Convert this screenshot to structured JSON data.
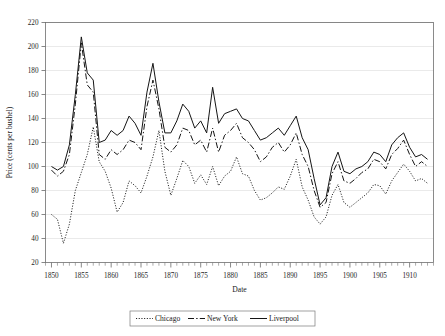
{
  "figure": {
    "title_clipped": "Wheat Prices: Chicago, New York and Liverpool",
    "background": "#ffffff",
    "ink_color": "#151515",
    "grid_color": "#d8d8d8"
  },
  "axes": {
    "ylabel": "Price (cents per bushel)",
    "xlabel": "Date",
    "ylim": [
      20,
      220
    ],
    "ytick_step": 20,
    "yticks": [
      20,
      40,
      60,
      80,
      100,
      120,
      140,
      160,
      180,
      200,
      220
    ],
    "xlim": [
      1849,
      1914
    ],
    "xtick_step": 5,
    "xticks": [
      1850,
      1855,
      1860,
      1865,
      1870,
      1875,
      1880,
      1885,
      1890,
      1895,
      1900,
      1905,
      1910
    ],
    "xminor_step": 1,
    "grid": "horizontal"
  },
  "legend": {
    "position": "below-axes",
    "entries": [
      {
        "label": "Chicago",
        "style": "dotted"
      },
      {
        "label": "New York",
        "style": "dash-dot"
      },
      {
        "label": "Liverpool",
        "style": "solid"
      }
    ]
  },
  "chart_data": {
    "type": "line",
    "title": "Wheat Prices: Chicago, New York and Liverpool",
    "xlabel": "Date",
    "ylabel": "Price (cents per bushel)",
    "xlim": [
      1849,
      1914
    ],
    "ylim": [
      20,
      220
    ],
    "grid": true,
    "legend_position": "bottom",
    "x": [
      1850,
      1851,
      1852,
      1853,
      1854,
      1855,
      1856,
      1857,
      1858,
      1859,
      1860,
      1861,
      1862,
      1863,
      1864,
      1865,
      1866,
      1867,
      1868,
      1869,
      1870,
      1871,
      1872,
      1873,
      1874,
      1875,
      1876,
      1877,
      1878,
      1879,
      1880,
      1881,
      1882,
      1883,
      1884,
      1885,
      1886,
      1887,
      1888,
      1889,
      1890,
      1891,
      1892,
      1893,
      1894,
      1895,
      1896,
      1897,
      1898,
      1899,
      1900,
      1901,
      1902,
      1903,
      1904,
      1905,
      1906,
      1907,
      1908,
      1909,
      1910,
      1911,
      1912,
      1913
    ],
    "series": [
      {
        "name": "Chicago",
        "style": "dotted",
        "values": [
          60,
          56,
          36,
          52,
          80,
          95,
          110,
          133,
          104,
          96,
          82,
          62,
          70,
          88,
          84,
          78,
          92,
          108,
          130,
          96,
          76,
          90,
          105,
          100,
          86,
          93,
          85,
          100,
          84,
          92,
          96,
          108,
          94,
          92,
          80,
          72,
          74,
          78,
          83,
          81,
          92,
          106,
          83,
          72,
          58,
          52,
          58,
          76,
          85,
          70,
          66,
          70,
          74,
          78,
          85,
          84,
          77,
          88,
          95,
          102,
          96,
          88,
          90,
          86
        ]
      },
      {
        "name": "New York",
        "style": "dash-dot",
        "values": [
          97,
          92,
          96,
          110,
          152,
          203,
          168,
          162,
          110,
          106,
          114,
          110,
          114,
          122,
          120,
          114,
          150,
          172,
          148,
          116,
          112,
          118,
          132,
          130,
          118,
          122,
          112,
          132,
          112,
          126,
          130,
          136,
          124,
          120,
          114,
          104,
          108,
          116,
          120,
          112,
          118,
          128,
          110,
          100,
          80,
          66,
          70,
          94,
          104,
          88,
          86,
          90,
          95,
          98,
          106,
          104,
          98,
          110,
          115,
          122,
          110,
          100,
          104,
          100
        ]
      },
      {
        "name": "Liverpool",
        "style": "solid",
        "values": [
          100,
          97,
          100,
          118,
          160,
          208,
          178,
          172,
          120,
          122,
          130,
          126,
          130,
          142,
          136,
          126,
          162,
          186,
          154,
          128,
          128,
          138,
          152,
          146,
          132,
          138,
          128,
          166,
          136,
          144,
          146,
          148,
          140,
          138,
          130,
          122,
          124,
          128,
          132,
          126,
          134,
          142,
          124,
          114,
          90,
          68,
          74,
          100,
          112,
          96,
          94,
          98,
          100,
          104,
          112,
          110,
          104,
          118,
          124,
          128,
          116,
          108,
          110,
          106
        ]
      }
    ]
  }
}
